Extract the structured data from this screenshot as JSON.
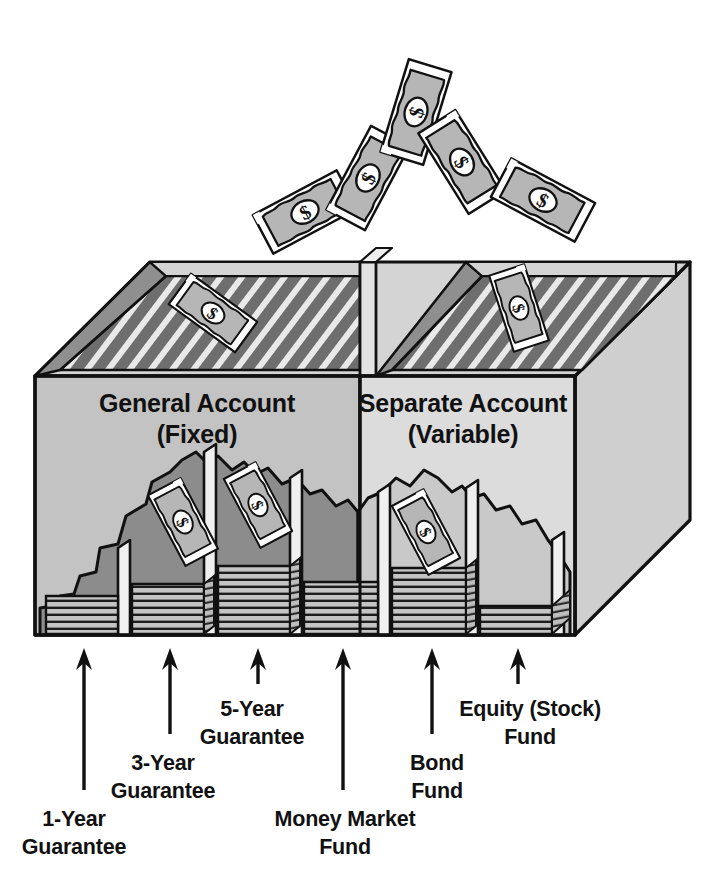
{
  "figure": {
    "kind": "cutaway-isometric-box-illustration",
    "background_color": "#ffffff",
    "line_color": "#111111"
  },
  "palette": {
    "ink": "#111111",
    "front_panel_left": "#c3c3c3",
    "front_panel_right": "#dcdcdc",
    "right_side_panel": "#cfcfcf",
    "top_rim": "#d4d4d4",
    "inner_wall_left": "#8f8f8f",
    "inner_floor_hatch_dark": "#6e6e6e",
    "inner_floor_hatch_light": "#e9e9e9",
    "bill_fill": "#b6b6b6",
    "bill_border": "#ffffff",
    "money_stack_fill": "#bdbdbd",
    "mound_dark": "#8c8c8c",
    "mound_light": "#c9c9c9",
    "divider_fill": "#e3e3e3"
  },
  "compartments": {
    "general_account": {
      "title_line1": "General Account",
      "title_line2": "(Fixed)",
      "slots": [
        {
          "label_line1": "1-Year",
          "label_line2": "Guarantee"
        },
        {
          "label_line1": "3-Year",
          "label_line2": "Guarantee"
        },
        {
          "label_line1": "5-Year",
          "label_line2": "Guarantee"
        }
      ]
    },
    "separate_account": {
      "title_line1": "Separate Account",
      "title_line2": "(Variable)",
      "slots": [
        {
          "label_line1": "Money Market",
          "label_line2": "Fund"
        },
        {
          "label_line1": "Bond",
          "label_line2": "Fund"
        },
        {
          "label_line1": "Equity (Stock)",
          "label_line2": "Fund"
        }
      ]
    }
  },
  "callouts": [
    {
      "id": "callout-1-year",
      "line1": "1-Year",
      "line2": "Guarantee",
      "arrow_x": 84,
      "arrow_top_y": 648,
      "arrow_bottom_y": 790,
      "text_x": 74,
      "text_y": 826,
      "anchor": "middle"
    },
    {
      "id": "callout-3-year",
      "line1": "3-Year",
      "line2": "Guarantee",
      "arrow_x": 170,
      "arrow_top_y": 648,
      "arrow_bottom_y": 734,
      "text_x": 163,
      "text_y": 770,
      "anchor": "middle"
    },
    {
      "id": "callout-5-year",
      "line1": "5-Year",
      "line2": "Guarantee",
      "arrow_x": 258,
      "arrow_top_y": 648,
      "arrow_bottom_y": 684,
      "text_x": 252,
      "text_y": 716,
      "anchor": "middle"
    },
    {
      "id": "callout-money-market",
      "line1": "Money Market",
      "line2": "Fund",
      "arrow_x": 343,
      "arrow_top_y": 648,
      "arrow_bottom_y": 790,
      "text_x": 345,
      "text_y": 826,
      "anchor": "middle"
    },
    {
      "id": "callout-bond",
      "line1": "Bond",
      "line2": "Fund",
      "arrow_x": 432,
      "arrow_top_y": 648,
      "arrow_bottom_y": 734,
      "text_x": 437,
      "text_y": 770,
      "anchor": "middle"
    },
    {
      "id": "callout-equity",
      "line1": "Equity (Stock)",
      "line2": "Fund",
      "arrow_x": 518,
      "arrow_top_y": 648,
      "arrow_bottom_y": 684,
      "text_x": 530,
      "text_y": 716,
      "anchor": "middle"
    }
  ],
  "falling_bills": [
    {
      "id": "falling-bill-1",
      "cx": 305,
      "cy": 212,
      "angle": -28
    },
    {
      "id": "falling-bill-2",
      "cx": 365,
      "cy": 175,
      "angle": -52
    },
    {
      "id": "falling-bill-3",
      "cx": 412,
      "cy": 110,
      "angle": -70
    },
    {
      "id": "falling-bill-4",
      "cx": 460,
      "cy": 160,
      "angle": 52
    },
    {
      "id": "falling-bill-5",
      "cx": 540,
      "cy": 200,
      "angle": 28
    }
  ],
  "landing_bills": [
    {
      "id": "landing-bill-general",
      "cx": 213,
      "cy": 313,
      "angle": 36
    },
    {
      "id": "landing-bill-separate",
      "cx": 519,
      "cy": 308,
      "angle": 8
    }
  ],
  "inner_bills": [
    {
      "id": "inner-bill-3-year",
      "cx": 183,
      "cy": 522,
      "angle": 32
    },
    {
      "id": "inner-bill-5-year",
      "cx": 255,
      "cy": 505,
      "angle": 32
    },
    {
      "id": "inner-bill-bond",
      "cx": 423,
      "cy": 530,
      "angle": 32
    }
  ],
  "bill_glyph": {
    "center_symbol": "$",
    "symbol_color": "#111111"
  }
}
